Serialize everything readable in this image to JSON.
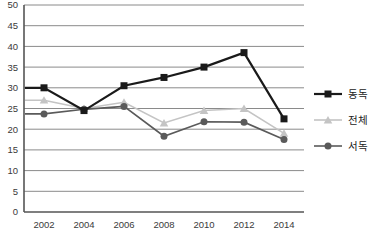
{
  "chart_data": {
    "type": "line",
    "title": "",
    "xlabel": "",
    "ylabel": "",
    "categories": [
      "2002",
      "2004",
      "2006",
      "2008",
      "2010",
      "2012",
      "2014"
    ],
    "series": [
      {
        "key": "east-germany",
        "name": "동독",
        "marker": "square",
        "color": "#1a1a1a",
        "line_width": 2.2,
        "values": [
          30,
          24.5,
          30.5,
          32.5,
          35,
          38.5,
          22.5
        ]
      },
      {
        "key": "total",
        "name": "전체",
        "marker": "triangle",
        "color": "#c4c4c4",
        "line_width": 1.6,
        "values": [
          27,
          25,
          26.5,
          21.5,
          24.5,
          25,
          19
        ]
      },
      {
        "key": "west-germany",
        "name": "서독",
        "marker": "circle",
        "color": "#5a5a5a",
        "line_width": 1.6,
        "values": [
          23.7,
          24.8,
          25.5,
          18.3,
          21.8,
          21.7,
          17.5
        ]
      }
    ],
    "ylim": [
      0,
      50
    ],
    "y_tick_step": 5,
    "y_tick_labels": [
      "0",
      "5",
      "10",
      "15",
      "20",
      "25",
      "30",
      "35",
      "40",
      "45",
      "50"
    ],
    "grid": true,
    "legend_position": "right",
    "colors": {
      "gridline": "#8a8a8a",
      "axis": "#555555",
      "tick_text": "#3a3a3a",
      "background": "#ffffff"
    }
  }
}
